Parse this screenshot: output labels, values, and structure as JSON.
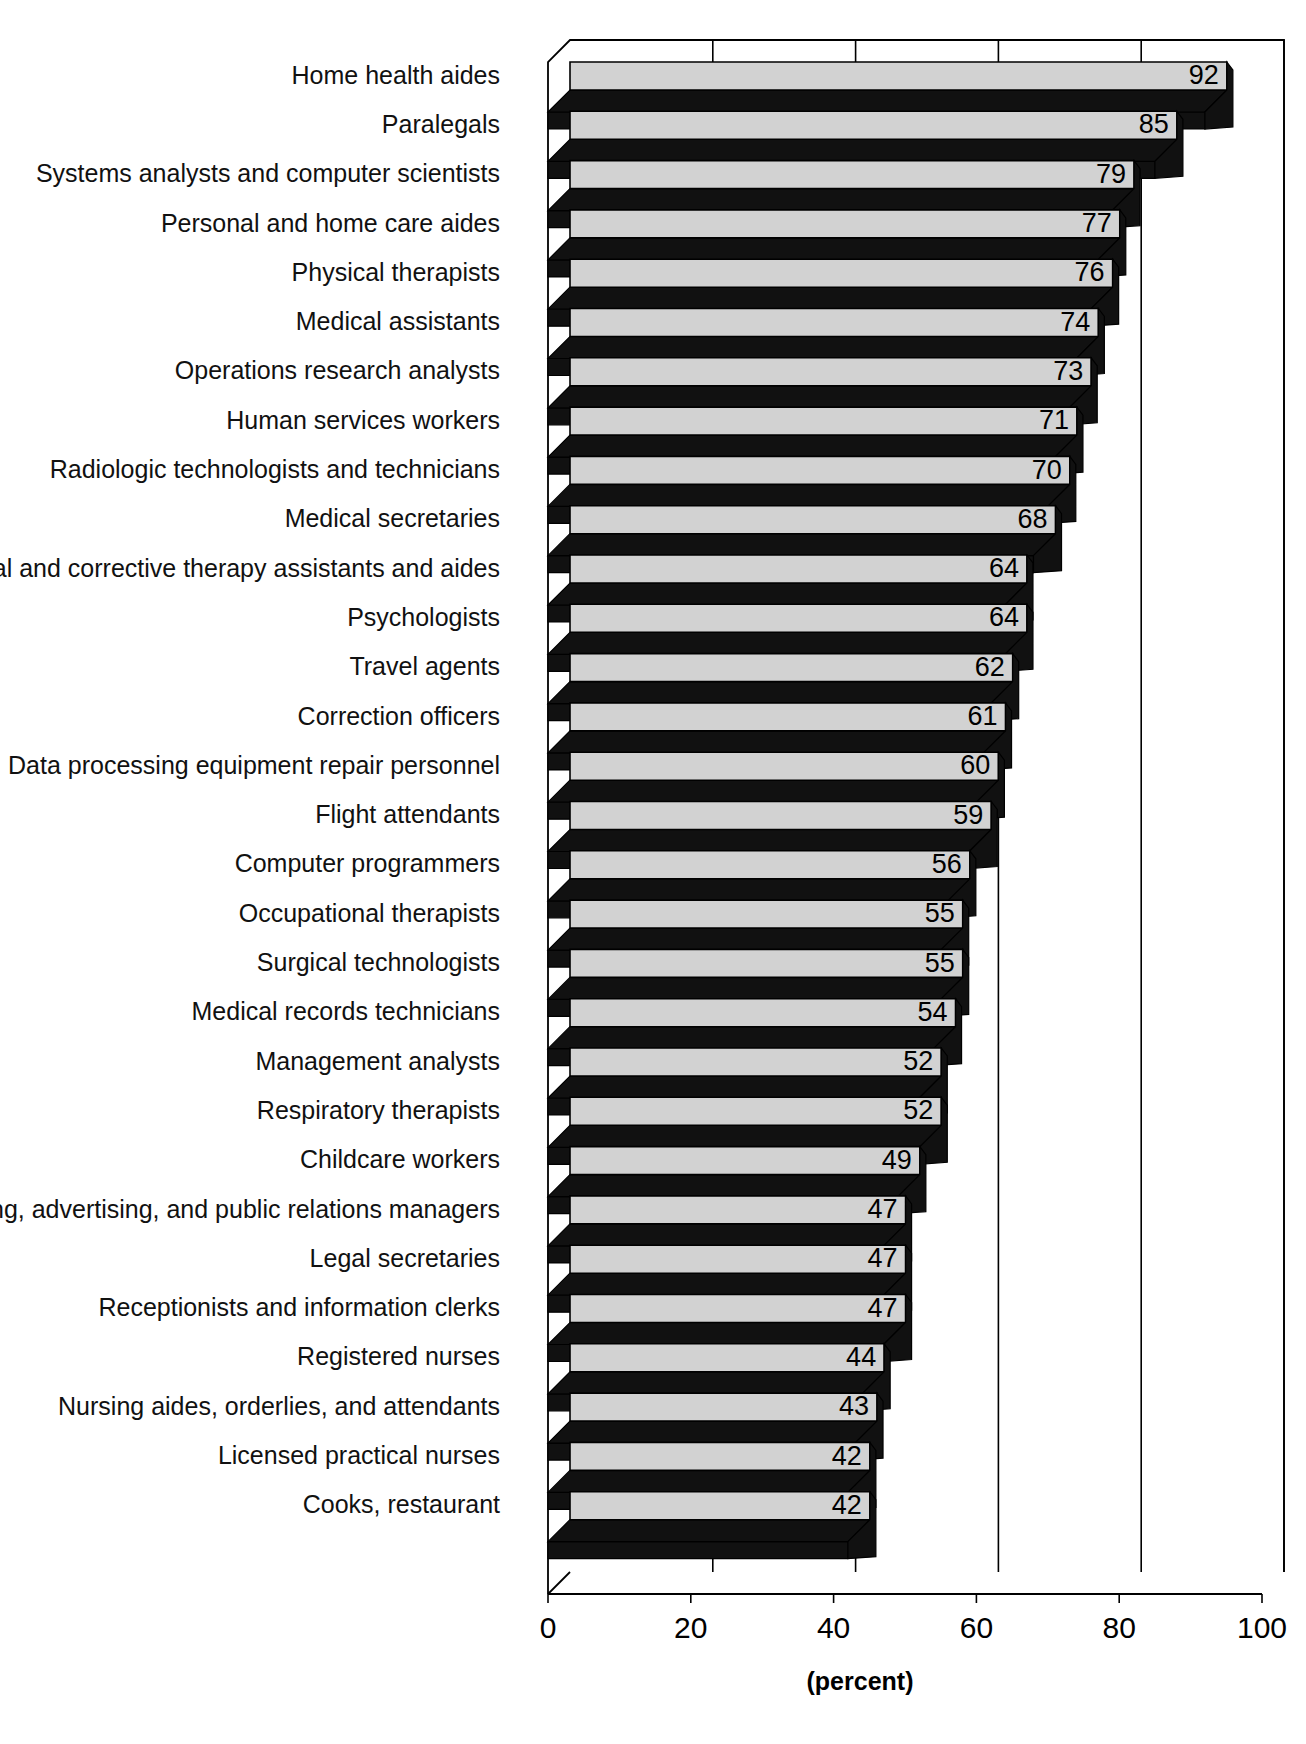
{
  "chart_data": {
    "type": "bar",
    "orientation": "horizontal",
    "title": "",
    "subtitle": "",
    "xlabel": "(percent)",
    "ylabel": "",
    "xlim": [
      0,
      100
    ],
    "xticks": [
      0,
      20,
      40,
      60,
      80,
      100
    ],
    "xtick_labels": [
      "0",
      "20",
      "40",
      "60",
      "80",
      "100"
    ],
    "grid": true,
    "grid_axis": "x",
    "legend": false,
    "legend_position": "none",
    "style_3d": true,
    "bar_face_color": "#d2d2d2",
    "bar_shadow_color": "#111111",
    "categories": [
      "Home health aides",
      "Paralegals",
      "Systems analysts and computer scientists",
      "Personal and home care aides",
      "Physical therapists",
      "Medical assistants",
      "Operations research analysts",
      "Human services workers",
      "Radiologic technologists and technicians",
      "Medical secretaries",
      "Physical and corrective therapy assistants and aides",
      "Psychologists",
      "Travel agents",
      "Correction officers",
      "Data processing equipment repair personnel",
      "Flight attendants",
      "Computer programmers",
      "Occupational therapists",
      "Surgical technologists",
      "Medical records technicians",
      "Management analysts",
      "Respiratory therapists",
      "Childcare workers",
      "Marketing, advertising, and public relations managers",
      "Legal secretaries",
      "Receptionists and information clerks",
      "Registered nurses",
      "Nursing aides, orderlies, and attendants",
      "Licensed practical nurses",
      "Cooks, restaurant"
    ],
    "values": [
      92,
      85,
      79,
      77,
      76,
      74,
      73,
      71,
      70,
      68,
      64,
      64,
      62,
      61,
      60,
      59,
      56,
      55,
      55,
      54,
      52,
      52,
      49,
      47,
      47,
      47,
      44,
      43,
      42,
      42
    ],
    "value_labels": [
      "92",
      "85",
      "79",
      "77",
      "76",
      "74",
      "73",
      "71",
      "70",
      "68",
      "64",
      "64",
      "62",
      "61",
      "60",
      "59",
      "56",
      "55",
      "55",
      "54",
      "52",
      "52",
      "49",
      "47",
      "47",
      "47",
      "44",
      "43",
      "42",
      "42"
    ]
  },
  "axis": {
    "x_title": "(percent)",
    "tick_labels": [
      "0",
      "20",
      "40",
      "60",
      "80",
      "100"
    ]
  }
}
